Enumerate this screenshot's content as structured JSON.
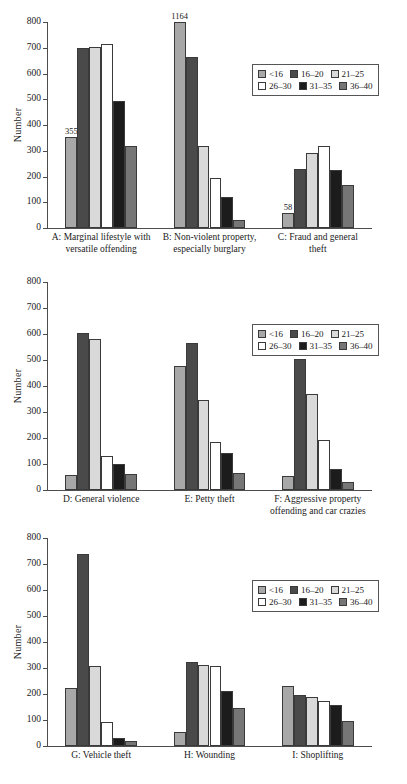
{
  "figure": {
    "ylabel": "Number",
    "ylim": [
      0,
      800
    ],
    "yticks": [
      0,
      100,
      200,
      300,
      400,
      500,
      600,
      700,
      800
    ],
    "legend_title": "",
    "legend_position": "upper right"
  },
  "series_colors": {
    "<16": "#a8a8a8",
    "16-20": "#4a4a4a",
    "21-25": "#d9d9d9",
    "26-30": "#ffffff",
    "31-35": "#1c1c1c",
    "36-40": "#767676"
  },
  "legend": {
    "rows": [
      [
        {
          "label": "<16",
          "color": "#a8a8a8"
        },
        {
          "label": "16–20",
          "color": "#4a4a4a"
        },
        {
          "label": "21–25",
          "color": "#d9d9d9"
        }
      ],
      [
        {
          "label": "26–30",
          "color": "#ffffff"
        },
        {
          "label": "31–35",
          "color": "#1c1c1c"
        },
        {
          "label": "36–40",
          "color": "#767676"
        }
      ]
    ]
  },
  "chart_data": [
    {
      "type": "bar",
      "title": "",
      "xlabel": "",
      "ylabel": "Number",
      "ylim": [
        0,
        800
      ],
      "yticks": [
        0,
        100,
        200,
        300,
        400,
        500,
        600,
        700,
        800
      ],
      "grid": false,
      "legend": [
        "<16",
        "16–20",
        "21–25",
        "26–30",
        "31–35",
        "36–40"
      ],
      "categories": [
        "A: Marginal lifestyle with versatile offending",
        "B: Non-violent property, especially burglary",
        "C: Fraud and general theft"
      ],
      "category_lines": [
        [
          "A: Marginal lifestyle with",
          "versatile offending"
        ],
        [
          "B: Non-violent property,",
          "especially burglary"
        ],
        [
          "C: Fraud and general",
          "theft"
        ]
      ],
      "series": [
        {
          "name": "<16",
          "values": [
            355,
            1164,
            58
          ]
        },
        {
          "name": "16–20",
          "values": [
            699,
            665,
            228
          ]
        },
        {
          "name": "21–25",
          "values": [
            702,
            318,
            293
          ]
        },
        {
          "name": "26–30",
          "values": [
            716,
            196,
            320
          ]
        },
        {
          "name": "31–35",
          "values": [
            495,
            120,
            224
          ]
        },
        {
          "name": "36–40",
          "values": [
            319,
            30,
            168
          ]
        }
      ],
      "annotations": [
        {
          "text": "355",
          "category": "A: Marginal lifestyle with versatile offending",
          "series": "<16",
          "value": 355
        },
        {
          "text": "1164",
          "category": "B: Non-violent property, especially burglary",
          "series": "<16",
          "value": 1164,
          "clipped": true
        },
        {
          "text": "58",
          "category": "C: Fraud and general theft",
          "series": "<16",
          "value": 58
        }
      ]
    },
    {
      "type": "bar",
      "title": "",
      "xlabel": "",
      "ylabel": "Number",
      "ylim": [
        0,
        800
      ],
      "yticks": [
        0,
        100,
        200,
        300,
        400,
        500,
        600,
        700,
        800
      ],
      "grid": false,
      "legend": [
        "<16",
        "16–20",
        "21–25",
        "26–30",
        "31–35",
        "36–40"
      ],
      "categories": [
        "D: General violence",
        "E: Petty theft",
        "F: Aggressive property offending and car crazies"
      ],
      "category_lines": [
        [
          "D: General violence"
        ],
        [
          "E: Petty theft"
        ],
        [
          "F: Aggressive property",
          "offending and car crazies"
        ]
      ],
      "series": [
        {
          "name": "<16",
          "values": [
            57,
            477,
            52
          ]
        },
        {
          "name": "16–20",
          "values": [
            604,
            566,
            504
          ]
        },
        {
          "name": "21–25",
          "values": [
            580,
            348,
            369
          ]
        },
        {
          "name": "26–30",
          "values": [
            132,
            184,
            191
          ]
        },
        {
          "name": "31–35",
          "values": [
            99,
            142,
            79
          ]
        },
        {
          "name": "36–40",
          "values": [
            62,
            66,
            30
          ]
        }
      ],
      "annotations": []
    },
    {
      "type": "bar",
      "title": "",
      "xlabel": "",
      "ylabel": "Number",
      "ylim": [
        0,
        800
      ],
      "yticks": [
        0,
        100,
        200,
        300,
        400,
        500,
        600,
        700,
        800
      ],
      "grid": false,
      "legend": [
        "<16",
        "16–20",
        "21–25",
        "26–30",
        "31–35",
        "36–40"
      ],
      "categories": [
        "G: Vehicle theft",
        "H: Wounding",
        "I: Shoplifting"
      ],
      "category_lines": [
        [
          "G: Vehicle theft"
        ],
        [
          "H: Wounding"
        ],
        [
          "I: Shoplifting"
        ]
      ],
      "series": [
        {
          "name": "<16",
          "values": [
            224,
            52,
            230
          ]
        },
        {
          "name": "16–20",
          "values": [
            739,
            322,
            197
          ]
        },
        {
          "name": "21–25",
          "values": [
            306,
            310,
            187
          ]
        },
        {
          "name": "26–30",
          "values": [
            93,
            308,
            172
          ]
        },
        {
          "name": "31–35",
          "values": [
            30,
            210,
            156
          ]
        },
        {
          "name": "36–40",
          "values": [
            18,
            147,
            95
          ]
        }
      ],
      "annotations": []
    }
  ]
}
